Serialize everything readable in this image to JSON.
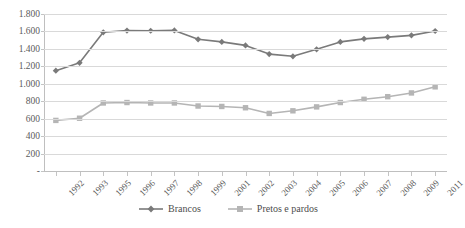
{
  "chart_data": {
    "type": "line",
    "title": "",
    "xlabel": "",
    "ylabel": "",
    "ylim": [
      0,
      1800
    ],
    "y_ticks": [
      "-",
      "200",
      "400",
      "600",
      "800",
      "1.000",
      "1.200",
      "1.400",
      "1.600",
      "1.800"
    ],
    "y_tick_values": [
      0,
      200,
      400,
      600,
      800,
      1000,
      1200,
      1400,
      1600,
      1800
    ],
    "grid": true,
    "legend_position": "bottom",
    "categories": [
      "1992",
      "1993",
      "1995",
      "1996",
      "1997",
      "1998",
      "1999",
      "2001",
      "2002",
      "2003",
      "2004",
      "2005",
      "2006",
      "2007",
      "2008",
      "2009",
      "2011"
    ],
    "series": [
      {
        "name": "Brancos",
        "color": "#7a7a7a",
        "marker": "diamond",
        "values": [
          1150,
          1240,
          1590,
          1610,
          1608,
          1612,
          1510,
          1480,
          1440,
          1340,
          1315,
          1395,
          1480,
          1515,
          1535,
          1555,
          1605
        ]
      },
      {
        "name": "Pretos e pardos",
        "color": "#b5b5b5",
        "marker": "square",
        "values": [
          580,
          605,
          780,
          785,
          780,
          780,
          745,
          740,
          725,
          660,
          690,
          735,
          785,
          822,
          852,
          895,
          965
        ]
      }
    ]
  },
  "legend": {
    "items": [
      {
        "label": "Brancos"
      },
      {
        "label": "Pretos e pardos"
      }
    ]
  }
}
